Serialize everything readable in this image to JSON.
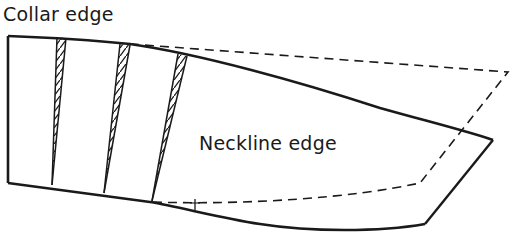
{
  "diagram": {
    "labels": {
      "collar_edge": "Collar edge",
      "neckline_edge": "Neckline edge"
    },
    "colors": {
      "line": "#1a1a1a",
      "background": "#ffffff"
    },
    "original_pattern": {
      "style": "solid",
      "collar_edge_path": "M8,36 C60,38 110,42 130,44 C200,54 300,82 380,108 C430,122 470,132 493,140",
      "outer_edge_path": "M493,140 L425,224",
      "neckline_edge_path": "M425,224 C380,232 310,232 260,224 C220,218 180,207 150,202 L8,183",
      "left_edge_path": "M8,183 L8,36"
    },
    "spread_pattern": {
      "style": "dashed",
      "path": "M130,44 L508,72 L420,183 C350,198 250,205 150,202"
    },
    "tick_mark": {
      "x": 195,
      "y1": 199,
      "y2": 209
    },
    "slash_strips": [
      {
        "top_left": [
          57,
          37
        ],
        "top_right": [
          66,
          38
        ],
        "bottom": [
          52,
          185
        ]
      },
      {
        "top_left": [
          120,
          44
        ],
        "top_right": [
          130,
          45
        ],
        "bottom": [
          104,
          193
        ]
      },
      {
        "top_left": [
          178,
          54
        ],
        "top_right": [
          187,
          55
        ],
        "bottom": [
          152,
          201
        ]
      }
    ]
  }
}
